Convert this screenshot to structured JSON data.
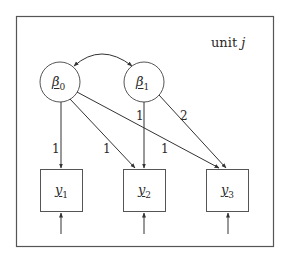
{
  "diagram": {
    "frame_label": {
      "text": "unit",
      "var": "j"
    },
    "latent_nodes": [
      {
        "id": "beta0",
        "symbol": "β",
        "sub": "0"
      },
      {
        "id": "beta1",
        "symbol": "β",
        "sub": "1"
      }
    ],
    "observed_nodes": [
      {
        "id": "y1",
        "symbol": "y",
        "sub": "1"
      },
      {
        "id": "y2",
        "symbol": "y",
        "sub": "2"
      },
      {
        "id": "y3",
        "symbol": "y",
        "sub": "3"
      }
    ],
    "edges": [
      {
        "from": "beta0",
        "to": "beta1",
        "type": "covariance",
        "label": ""
      },
      {
        "from": "beta0",
        "to": "y1",
        "label": "1"
      },
      {
        "from": "beta0",
        "to": "y2",
        "label": "1"
      },
      {
        "from": "beta0",
        "to": "y3",
        "label": "1"
      },
      {
        "from": "beta1",
        "to": "y2",
        "label": "1"
      },
      {
        "from": "beta1",
        "to": "y3",
        "label": "2"
      }
    ],
    "error_arrows": [
      "y1",
      "y2",
      "y3"
    ]
  }
}
